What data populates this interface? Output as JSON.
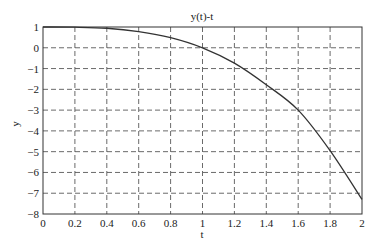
{
  "chart_data": {
    "type": "line",
    "title": "y(t)-t",
    "xlabel": "t",
    "ylabel": "y",
    "xlim": [
      0,
      2
    ],
    "ylim": [
      -8,
      1
    ],
    "grid": true,
    "xticks": [
      0,
      0.2,
      0.4,
      0.6,
      0.8,
      1,
      1.2,
      1.4,
      1.6,
      1.8,
      2
    ],
    "xtick_labels": [
      "0",
      "0.2",
      "0.4",
      "0.6",
      "0.8",
      "1",
      "1.2",
      "1.4",
      "1.6",
      "1.8",
      "2"
    ],
    "yticks": [
      1,
      0,
      -1,
      -2,
      -3,
      -4,
      -5,
      -6,
      -7,
      -8
    ],
    "ytick_labels": [
      "1",
      "0",
      "−1",
      "−2",
      "−3",
      "−4",
      "−5",
      "−6",
      "−7",
      "−8"
    ],
    "series": [
      {
        "name": "y(t)",
        "x": [
          0,
          0.2,
          0.4,
          0.6,
          0.8,
          1.0,
          1.2,
          1.4,
          1.6,
          1.8,
          2.0
        ],
        "y": [
          1,
          0.99,
          0.94,
          0.78,
          0.49,
          0.0,
          -0.74,
          -1.78,
          -3.0,
          -4.95,
          -7.3
        ]
      }
    ]
  }
}
